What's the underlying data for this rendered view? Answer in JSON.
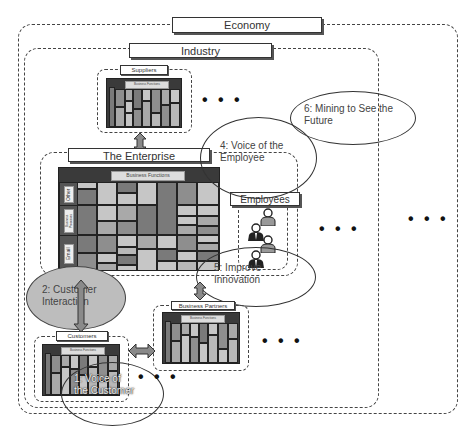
{
  "containers": {
    "economy": {
      "label": "Economy"
    },
    "industry": {
      "label": "Industry"
    },
    "suppliers": {
      "label": "Suppliers",
      "matrix_header": "Business Functions"
    },
    "enterprise": {
      "label": "The Enterprise",
      "matrix_header": "Business Functions",
      "row_labels": [
        "Other",
        "Business Processes",
        "Email"
      ]
    },
    "employees": {
      "label": "Employees"
    },
    "customers": {
      "label": "Customers",
      "matrix_header": "Business Functions"
    },
    "business_partners": {
      "label": "Business Partners",
      "matrix_header": "Business Functions"
    }
  },
  "callouts": [
    {
      "id": 1,
      "text": "1: Voice of the Customer"
    },
    {
      "id": 2,
      "text": "2: Customer Interaction"
    },
    {
      "id": 4,
      "text": "4: Voice of the Employee"
    },
    {
      "id": 5,
      "text": "5: Improve Innovation"
    },
    {
      "id": 6,
      "text": "6: Mining to See the Future"
    }
  ],
  "ellipsis": "• • •",
  "colors": {
    "dash_border": "#444444",
    "matrix_frame": "#3a3a3a",
    "cell_dark": "#7a7a7a",
    "cell_mid": "#a9a9a9",
    "cell_light": "#c6c6c6",
    "interaction_fill": "#bdbdbd",
    "arrow_fill": "#8a8a8a"
  }
}
